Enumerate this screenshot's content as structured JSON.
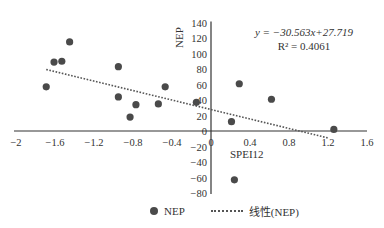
{
  "chart_data": {
    "type": "scatter",
    "title": "",
    "xlabel": "SPEI12",
    "ylabel": "NEP",
    "xlim": [
      -2,
      1.6
    ],
    "ylim": [
      -80,
      140
    ],
    "x_ticks": [
      "-2",
      "-1.6",
      "-1.2",
      "-0.8",
      "-0.4",
      "0",
      "0.4",
      "0.8",
      "1.2",
      "1.6"
    ],
    "y_ticks": [
      "140",
      "120",
      "100",
      "80",
      "60",
      "40",
      "20",
      "0",
      "-20",
      "-40",
      "-60",
      "-80"
    ],
    "grid": false,
    "legend_position": "bottom",
    "series": [
      {
        "name": "NEP",
        "type": "scatter",
        "color": "#4a4a4a",
        "points": [
          {
            "x": -1.69,
            "y": 57
          },
          {
            "x": -1.61,
            "y": 89
          },
          {
            "x": -1.53,
            "y": 90
          },
          {
            "x": -1.45,
            "y": 115
          },
          {
            "x": -0.95,
            "y": 83
          },
          {
            "x": -0.95,
            "y": 44
          },
          {
            "x": -0.83,
            "y": 18
          },
          {
            "x": -0.77,
            "y": 34
          },
          {
            "x": -0.54,
            "y": 35
          },
          {
            "x": -0.47,
            "y": 57
          },
          {
            "x": -0.15,
            "y": 37
          },
          {
            "x": 0.21,
            "y": 12
          },
          {
            "x": 0.24,
            "y": -63
          },
          {
            "x": 0.29,
            "y": 61
          },
          {
            "x": 0.62,
            "y": 41
          },
          {
            "x": 1.26,
            "y": 2
          }
        ]
      },
      {
        "name": "线性(NEP)",
        "type": "line",
        "style": "dotted",
        "color": "#555555",
        "slope": -30.563,
        "intercept": 27.719,
        "x_range": [
          -1.69,
          1.2
        ]
      }
    ],
    "annotations": {
      "equation": "y = −30.563x+27.719",
      "r_squared": "R² = 0.4061"
    }
  },
  "legend": {
    "scatter_label": "NEP",
    "trend_label": "线性(NEP)"
  }
}
